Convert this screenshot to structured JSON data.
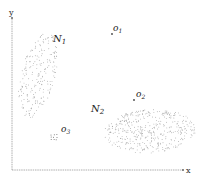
{
  "diagram": {
    "title": "",
    "axes": {
      "x_label": "x",
      "y_label": "y",
      "color": "#888888"
    },
    "clusters": [
      {
        "id": "N1",
        "label": "N",
        "subscript": "1",
        "cx": 38,
        "cy": 75,
        "rx": 17,
        "ry": 44,
        "rotate": 14,
        "count": 230,
        "label_x": 53,
        "label_y": 42
      },
      {
        "id": "N2",
        "label": "N",
        "subscript": "2",
        "cx": 150,
        "cy": 131,
        "rx": 46,
        "ry": 22,
        "rotate": -4,
        "count": 420,
        "label_x": 91,
        "label_y": 112
      }
    ],
    "outliers": [
      {
        "id": "o1",
        "label": "o",
        "subscript": "1",
        "x": 112,
        "y": 34,
        "label_x": 113,
        "label_y": 31
      },
      {
        "id": "o2",
        "label": "o",
        "subscript": "2",
        "x": 134,
        "y": 100,
        "label_x": 136,
        "label_y": 97
      }
    ],
    "small_cluster": {
      "id": "o3",
      "label": "o",
      "subscript": "3",
      "cx": 54,
      "cy": 137,
      "r": 4,
      "count": 9,
      "label_x": 61,
      "label_y": 132
    },
    "point_color": "#8a8a8a"
  }
}
